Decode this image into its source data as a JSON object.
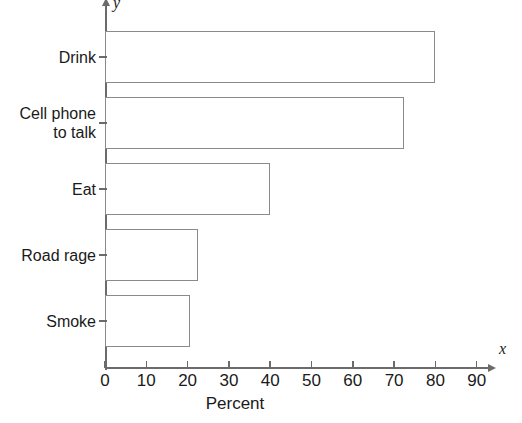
{
  "chart_data": {
    "type": "bar",
    "orientation": "horizontal",
    "title": "",
    "xlabel": "Percent",
    "ylabel": "",
    "x_axis_variable": "x",
    "y_axis_variable": "y",
    "categories": [
      "Drink",
      "Cell phone to talk",
      "Eat",
      "Road rage",
      "Smoke"
    ],
    "values": [
      80,
      72.5,
      40,
      22.5,
      20.5
    ],
    "xlim": [
      0,
      90
    ],
    "x_ticks": [
      0,
      10,
      20,
      30,
      40,
      50,
      60,
      70,
      80,
      90
    ],
    "x_tick_labels": [
      "0",
      "10",
      "20",
      "30",
      "40",
      "50",
      "60",
      "70",
      "80",
      "90"
    ],
    "grid": false,
    "legend": false,
    "bar_fill_color": "#ffffff",
    "bar_border_color": "#8a8a8a",
    "axis_color": "#6b6b6b",
    "background_color": "#ffffff"
  },
  "axis": {
    "x_variable_label": "x",
    "y_variable_label": "y",
    "x_title": "Percent"
  },
  "categories": [
    {
      "line1": "Drink",
      "line2": ""
    },
    {
      "line1": "Cell phone",
      "line2": "to talk"
    },
    {
      "line1": "Eat",
      "line2": ""
    },
    {
      "line1": "Road rage",
      "line2": ""
    },
    {
      "line1": "Smoke",
      "line2": ""
    }
  ],
  "x_tick_labels": [
    "0",
    "10",
    "20",
    "30",
    "40",
    "50",
    "60",
    "70",
    "80",
    "90"
  ]
}
